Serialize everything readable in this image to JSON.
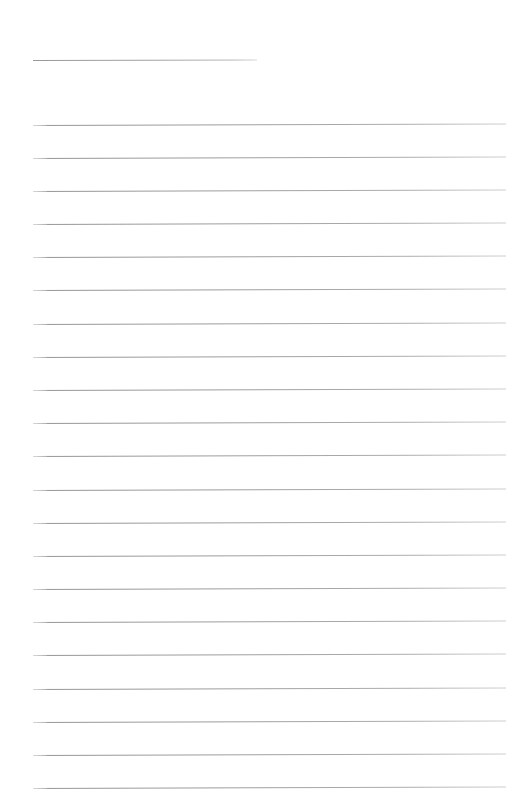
{
  "document": {
    "kind": "lined-note-paper",
    "page_width": 529,
    "page_height": 812,
    "background_color": "#ffffff",
    "text_content": "",
    "title_text": "",
    "heading_rule": {
      "label": "title-rule",
      "left": 33,
      "top": 60,
      "width": 224,
      "color": "#9a9a9e"
    },
    "body_rules": {
      "label": "writing-lines",
      "count": 21,
      "left": 33,
      "right": 506,
      "width": 473,
      "first_top": 125,
      "spacing": 33.2,
      "color": "#9d9da2",
      "thickness": 1,
      "tops": [
        125,
        158,
        191,
        224,
        257,
        290,
        324,
        357,
        390,
        423,
        456,
        490,
        523,
        556,
        589,
        622,
        655,
        689,
        722,
        755,
        788
      ]
    }
  }
}
